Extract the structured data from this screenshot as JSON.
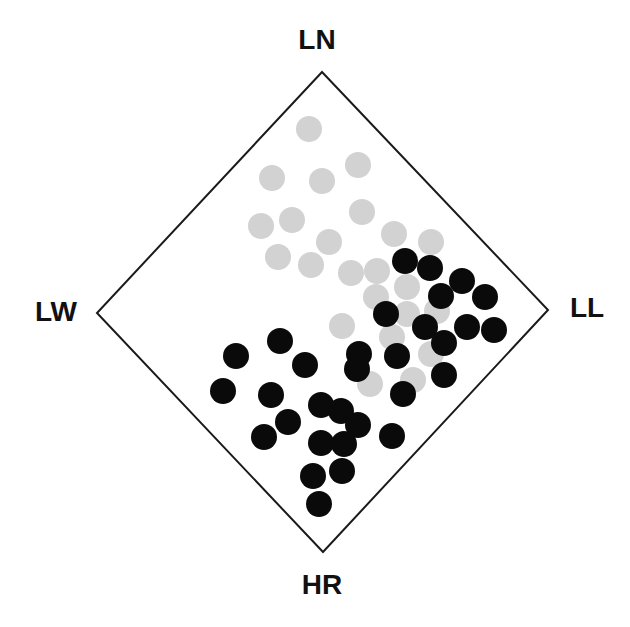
{
  "chart_data": {
    "type": "scatter",
    "title": "",
    "plot_shape": "diamond",
    "vertices": {
      "top": {
        "label": "LN",
        "px": [
          322,
          72
        ]
      },
      "left": {
        "label": "LW",
        "px": [
          97,
          313
        ]
      },
      "right": {
        "label": "LL",
        "px": [
          548,
          310
        ]
      },
      "bottom": {
        "label": "HR",
        "px": [
          323,
          552
        ]
      }
    },
    "labels": {
      "top": "LN",
      "left": "LW",
      "right": "LL",
      "bottom": "HR"
    },
    "label_positions": {
      "top": [
        317,
        40
      ],
      "left": [
        56,
        312
      ],
      "right": [
        587,
        308
      ],
      "bottom": [
        322,
        585
      ]
    },
    "marker_radius": 13,
    "grid": false,
    "legend": null,
    "series": [
      {
        "name": "gray",
        "color": "#d2d2d2",
        "points_px": [
          [
            309,
            129
          ],
          [
            358,
            165
          ],
          [
            272,
            178
          ],
          [
            322,
            181
          ],
          [
            362,
            212
          ],
          [
            292,
            220
          ],
          [
            261,
            226
          ],
          [
            394,
            234
          ],
          [
            329,
            242
          ],
          [
            431,
            242
          ],
          [
            278,
            257
          ],
          [
            311,
            265
          ],
          [
            351,
            273
          ],
          [
            377,
            271
          ],
          [
            407,
            287
          ],
          [
            376,
            297
          ],
          [
            437,
            311
          ],
          [
            407,
            314
          ],
          [
            342,
            326
          ],
          [
            392,
            337
          ],
          [
            431,
            354
          ],
          [
            413,
            380
          ],
          [
            370,
            384
          ]
        ]
      },
      {
        "name": "black",
        "color": "#0a0a0a",
        "points_px": [
          [
            405,
            261
          ],
          [
            430,
            268
          ],
          [
            462,
            281
          ],
          [
            441,
            296
          ],
          [
            485,
            297
          ],
          [
            386,
            314
          ],
          [
            425,
            327
          ],
          [
            467,
            327
          ],
          [
            494,
            330
          ],
          [
            444,
            343
          ],
          [
            359,
            354
          ],
          [
            397,
            356
          ],
          [
            357,
            369
          ],
          [
            444,
            375
          ],
          [
            403,
            394
          ],
          [
            280,
            341
          ],
          [
            236,
            356
          ],
          [
            305,
            365
          ],
          [
            223,
            391
          ],
          [
            271,
            395
          ],
          [
            321,
            405
          ],
          [
            341,
            411
          ],
          [
            288,
            422
          ],
          [
            358,
            425
          ],
          [
            392,
            436
          ],
          [
            264,
            437
          ],
          [
            321,
            443
          ],
          [
            344,
            444
          ],
          [
            342,
            471
          ],
          [
            313,
            476
          ],
          [
            319,
            504
          ]
        ]
      }
    ]
  }
}
